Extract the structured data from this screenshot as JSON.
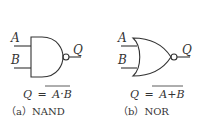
{
  "gates": [
    {
      "id": "nand",
      "input_a": "A",
      "input_b": "B",
      "output": "Q",
      "formula_lhs": "Q",
      "formula_eq": "=",
      "formula_rhs": "A·B",
      "caption": "（a）NAND"
    },
    {
      "id": "nor",
      "input_a": "A",
      "input_b": "B",
      "output": "Q",
      "formula_lhs": "Q",
      "formula_eq": "=",
      "formula_rhs": "A+B",
      "caption": "（b）NOR"
    }
  ],
  "colors": {
    "stroke": "#333333",
    "background": "#ffffff"
  }
}
